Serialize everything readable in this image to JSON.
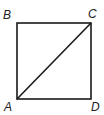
{
  "diagram": {
    "vertices": {
      "A": {
        "label": "A",
        "x": 17,
        "y": 99
      },
      "B": {
        "label": "B",
        "x": 17,
        "y": 23
      },
      "C": {
        "label": "C",
        "x": 91,
        "y": 23
      },
      "D": {
        "label": "D",
        "x": 91,
        "y": 99
      }
    },
    "diagonal": [
      "A",
      "C"
    ],
    "stroke_color": "#1a1a1a"
  }
}
